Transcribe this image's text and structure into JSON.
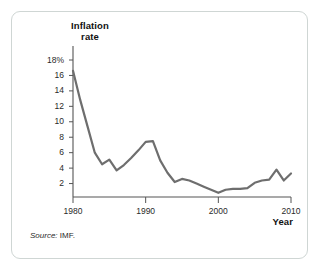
{
  "figure": {
    "source_note_prefix": "Source:",
    "source_note_value": "IMF.",
    "border_color": "#cfd6d4",
    "background_color": "#ffffff"
  },
  "chart_data": {
    "type": "line",
    "title": "",
    "subtitle": "",
    "ylabel": "Inflation rate",
    "xlabel": "Year",
    "ylabel_line1": "Inflation",
    "ylabel_line2": "rate",
    "xlim": [
      1980,
      2010
    ],
    "ylim": [
      0,
      18
    ],
    "grid": false,
    "legend": "none",
    "line_color": "#6e6e6e",
    "line_width": 2.2,
    "y_tick_values": [
      18,
      16,
      14,
      12,
      10,
      8,
      6,
      4,
      2
    ],
    "y_tick_labels": [
      "18%",
      "16",
      "14",
      "12",
      "10",
      "8",
      "6",
      "4",
      "2"
    ],
    "x_tick_values": [
      1980,
      1990,
      2000,
      2010
    ],
    "x_tick_labels": [
      "1980",
      "1990",
      "2000",
      "2010"
    ],
    "x": [
      1980,
      1981,
      1982,
      1983,
      1984,
      1985,
      1986,
      1987,
      1988,
      1989,
      1990,
      1991,
      1992,
      1993,
      1994,
      1995,
      1996,
      1997,
      1998,
      1999,
      2000,
      2001,
      2002,
      2003,
      2004,
      2005,
      2006,
      2007,
      2008,
      2009,
      2010
    ],
    "values": [
      16.6,
      12.8,
      9.4,
      6.0,
      4.5,
      5.1,
      3.7,
      4.4,
      5.3,
      6.3,
      7.4,
      7.5,
      5.0,
      3.4,
      2.2,
      2.6,
      2.4,
      2.0,
      1.6,
      1.2,
      0.8,
      1.2,
      1.3,
      1.3,
      1.4,
      2.1,
      2.4,
      2.5,
      3.8,
      2.4,
      3.3
    ],
    "series": [
      {
        "name": "Inflation rate",
        "values": [
          16.6,
          12.8,
          9.4,
          6.0,
          4.5,
          5.1,
          3.7,
          4.4,
          5.3,
          6.3,
          7.4,
          7.5,
          5.0,
          3.4,
          2.2,
          2.6,
          2.4,
          2.0,
          1.6,
          1.2,
          0.8,
          1.2,
          1.3,
          1.3,
          1.4,
          2.1,
          2.4,
          2.5,
          3.8,
          2.4,
          3.3
        ]
      }
    ]
  }
}
